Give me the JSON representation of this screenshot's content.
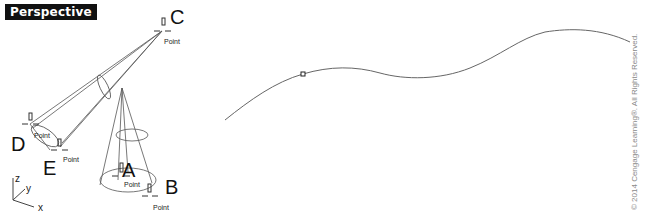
{
  "viewport": {
    "title": "Perspective"
  },
  "points": {
    "A": {
      "letter": "A",
      "label": "Point"
    },
    "B": {
      "letter": "B",
      "label": "Point"
    },
    "C": {
      "letter": "C",
      "label": "Point"
    },
    "D": {
      "letter": "D",
      "label": "Point"
    },
    "E": {
      "letter": "E",
      "label": "Point"
    }
  },
  "axes": {
    "x": "x",
    "y": "y",
    "z": "z"
  },
  "colors": {
    "line": "#555555",
    "curve": "#666666",
    "label_bg": "#111111",
    "copyright": "#8a8a8a"
  },
  "copyright": "© 2014 Cengage Learning®. All Rights Reserved."
}
